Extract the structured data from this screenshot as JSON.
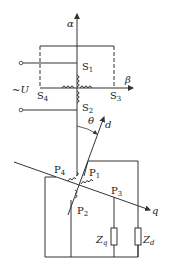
{
  "diagram": {
    "type": "winding-axis transformation diagram",
    "axes": {
      "alpha": "α",
      "beta": "β",
      "d": "d",
      "q": "q",
      "angle": "θ"
    },
    "stator_terminals": {
      "s1": {
        "letter": "S",
        "index": "1"
      },
      "s2": {
        "letter": "S",
        "index": "2"
      },
      "s3": {
        "letter": "S",
        "index": "3"
      },
      "s4": {
        "letter": "S",
        "index": "4"
      }
    },
    "rotor_terminals": {
      "p1": {
        "letter": "P",
        "index": "1"
      },
      "p2": {
        "letter": "P",
        "index": "2"
      },
      "p3": {
        "letter": "P",
        "index": "3"
      },
      "p4": {
        "letter": "P",
        "index": "4"
      }
    },
    "source_label": "~U",
    "impedances": {
      "zq": {
        "letter": "Z",
        "index": "q"
      },
      "zd": {
        "letter": "Z",
        "index": "d"
      }
    },
    "colors": {
      "line": "#333333",
      "background": "#ffffff"
    }
  }
}
